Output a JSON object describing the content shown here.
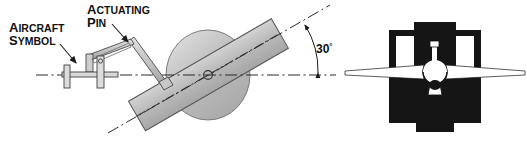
{
  "figure": {
    "background_color": "#ffffff",
    "labels": {
      "aircraft_symbol": {
        "line1_lead": "A",
        "line1_rest": "IRCRAFT",
        "line2_lead": "S",
        "line2_rest": "YMBOL",
        "full": "AIRCRAFT SYMBOL"
      },
      "actuating_pin": {
        "line1_lead": "A",
        "line1_rest": "CTUATING",
        "line2_lead": "P",
        "line2_rest": "IN",
        "full": "ACTUATING PIN"
      },
      "angle": {
        "value": "30",
        "unit": "°",
        "full": "30°"
      }
    },
    "colors": {
      "line": "#1a1a1a",
      "disc_fill": "#b5b5b5",
      "disc_highlight": "#d8d8d8",
      "bar_fill": "#b0b0b0",
      "bar_highlight": "#cfcfcf",
      "mechanism_fill": "#d0d0d0",
      "instrument_body": "#151515",
      "instrument_white": "#ffffff",
      "centerline": "#2b2b2b"
    },
    "parts": {
      "left_view": "side elevation of gyro disc with tilted bar, actuating pin linkage and aircraft symbol",
      "right_view": "front view of attitude indicator face with white wing symbol",
      "angle_arc": "30 degree arc between horizontal datum and tilted centerline",
      "centerline_style": "dash-dot"
    }
  }
}
